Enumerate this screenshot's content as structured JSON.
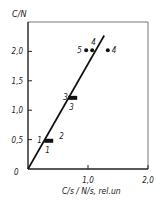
{
  "chart_data": {
    "type": "scatter",
    "title": "",
    "xlabel": "C/s / N/s, rel.un",
    "ylabel": "C/N",
    "xlim": [
      0,
      2.0
    ],
    "ylim": [
      0,
      2.5
    ],
    "x_ticks": [
      {
        "value": 1.0,
        "label": "1,0"
      },
      {
        "value": 2.0,
        "label": "2,0"
      }
    ],
    "y_ticks": [
      {
        "value": 0.5,
        "label": "0,5"
      },
      {
        "value": 1.0,
        "label": "1,0"
      },
      {
        "value": 1.5,
        "label": "1,5"
      },
      {
        "value": 2.0,
        "label": "2,0"
      }
    ],
    "origin_label": "0",
    "grid": false,
    "points": [
      {
        "x": 0.32,
        "y": 0.48,
        "labels": [
          "1",
          "2",
          "1"
        ],
        "marker": "bar"
      },
      {
        "x": 0.72,
        "y": 1.21,
        "labels": [
          "3",
          "3"
        ],
        "marker": "bar"
      },
      {
        "x": 0.97,
        "y": 2.02,
        "labels": [
          "5"
        ],
        "marker": "dot"
      },
      {
        "x": 1.07,
        "y": 2.02,
        "labels": [
          "4"
        ],
        "marker": "dot"
      },
      {
        "x": 1.33,
        "y": 2.02,
        "labels": [
          "4"
        ],
        "marker": "dot"
      }
    ],
    "fit_line": {
      "x0": 0.0,
      "y0": 0.0,
      "x1": 1.27,
      "y1": 2.27
    }
  },
  "colors": {
    "ink": "#1a1a1a",
    "axis": "#333333",
    "background": "#ffffff"
  }
}
